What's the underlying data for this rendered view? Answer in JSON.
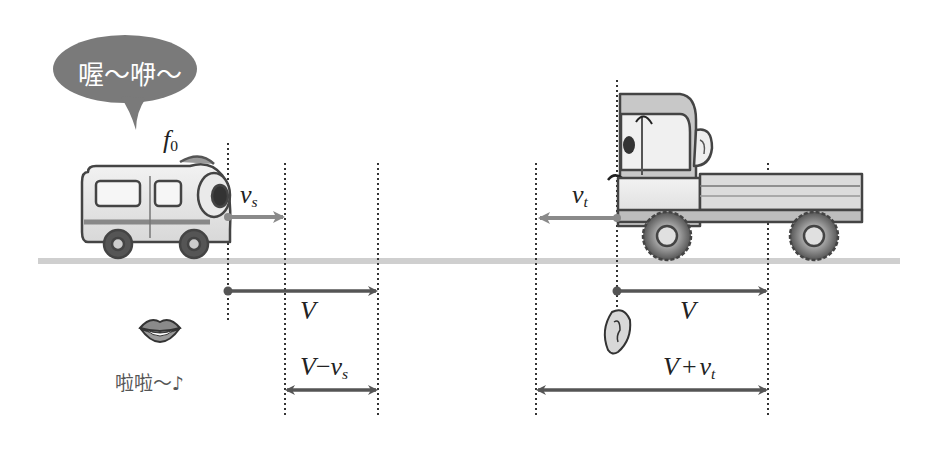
{
  "source": {
    "speech_bubble_text": "喔～咿～",
    "frequency_label": "f",
    "frequency_sub": "0",
    "velocity_label": "v",
    "velocity_sub": "s",
    "vehicle": "van"
  },
  "observer": {
    "velocity_label": "v",
    "velocity_sub": "t",
    "vehicle": "truck"
  },
  "sound_wave": {
    "left_speed_label": "V",
    "right_speed_label": "V",
    "lips_caption": "啦啦～♪"
  },
  "wavelength_labels": {
    "source_side_main": "V",
    "source_side_op": "−",
    "source_side_var": "v",
    "source_side_sub": "s",
    "observer_side_main": "V",
    "observer_side_op": "+",
    "observer_side_var": "v",
    "observer_side_sub": "t"
  },
  "colors": {
    "arrow_dark": "#555555",
    "arrow_light": "#8a8a8a",
    "ground": "#cfcfcf",
    "bubble": "#7a7a7a",
    "vehicle_body": "#e6e6e6",
    "vehicle_outline": "#444444"
  }
}
